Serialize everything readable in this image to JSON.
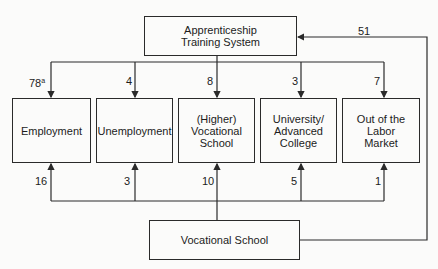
{
  "diagram": {
    "top_box": {
      "label": "Apprenticeship Training System"
    },
    "bottom_box": {
      "label": "Vocational School"
    },
    "outcomes": [
      {
        "label": "Employment",
        "from_apprenticeship": "78",
        "from_apprenticeship_note": "a",
        "from_vocational": "16"
      },
      {
        "label": "Unemployment",
        "from_apprenticeship": "4",
        "from_vocational": "3"
      },
      {
        "label": "(Higher) Vocational School",
        "from_apprenticeship": "8",
        "from_vocational": "10"
      },
      {
        "label": "University/ Advanced College",
        "from_apprenticeship": "3",
        "from_vocational": "5"
      },
      {
        "label": "Out of the Labor Market",
        "from_apprenticeship": "7",
        "from_vocational": "1"
      }
    ],
    "feedback": {
      "label": "51",
      "from": "Vocational School",
      "to": "Apprenticeship Training System"
    }
  }
}
